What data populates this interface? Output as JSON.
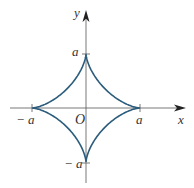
{
  "figure": {
    "type": "astroid",
    "equation": "x^(2/3) + y^(2/3) = a^(2/3)",
    "center": [
      86,
      108
    ],
    "a_px": 54,
    "curve_color": "#2b5c7c",
    "axis_color": "#555555"
  },
  "labels": {
    "y_axis": "y",
    "x_axis": "x",
    "origin": "O",
    "top": "a",
    "right": "a",
    "left": "− a",
    "bottom": "− a"
  }
}
